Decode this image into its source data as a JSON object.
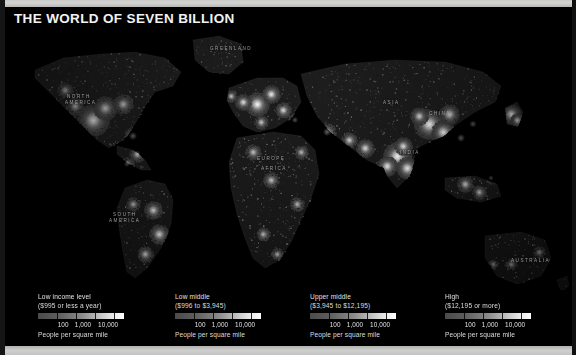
{
  "document": {
    "title": "THE WORLD OF SEVEN BILLION"
  },
  "map": {
    "name": "world-population-density-map",
    "background_color": "#000000",
    "geo_labels": [
      {
        "name": "greenland",
        "text": "GREENLAND",
        "x": 205,
        "y": 18
      },
      {
        "name": "north-america",
        "text": "NORTH",
        "x": 62,
        "y": 66
      },
      {
        "name": "north-america-2",
        "text": "AMERICA",
        "x": 60,
        "y": 72
      },
      {
        "name": "europe",
        "text": "EUROPE",
        "x": 252,
        "y": 128
      },
      {
        "name": "asia",
        "text": "ASIA",
        "x": 378,
        "y": 72
      },
      {
        "name": "china",
        "text": "CHINA",
        "x": 424,
        "y": 83
      },
      {
        "name": "india",
        "text": "INDIA",
        "x": 395,
        "y": 122
      },
      {
        "name": "africa",
        "text": "AFRICA",
        "x": 256,
        "y": 138
      },
      {
        "name": "south-america",
        "text": "SOUTH",
        "x": 108,
        "y": 184
      },
      {
        "name": "south-america-2",
        "text": "AMERICA",
        "x": 104,
        "y": 190
      },
      {
        "name": "australia",
        "text": "AUSTRALIA",
        "x": 506,
        "y": 230
      }
    ]
  },
  "legend": {
    "units_label": "People per square mile",
    "scale_ticks": [
      "100",
      "1,000",
      "10,000"
    ],
    "tick_positions_pct": [
      28,
      50,
      78
    ],
    "gradient_from": "#4a4a4a",
    "gradient_to": "#ffffff",
    "blocks": [
      {
        "id": "low-income",
        "title": "Low income level",
        "subtitle": "($995 or less a year)",
        "units": "People per square mile",
        "ticks": [
          "100",
          "1,000",
          "10,000"
        ]
      },
      {
        "id": "low-middle",
        "title": "Low middle",
        "subtitle": "($996 to $3,945)",
        "units": "People per square mile",
        "ticks": [
          "100",
          "1,000",
          "10,000"
        ]
      },
      {
        "id": "upper-middle",
        "title": "Upper middle",
        "subtitle": "($3,945 to $12,195)",
        "units": "People per square mile",
        "ticks": [
          "100",
          "1,000",
          "10,000"
        ]
      },
      {
        "id": "high",
        "title": "High",
        "subtitle": "($12,195 or more)",
        "units": "People per square mile",
        "ticks": [
          "100",
          "1,000",
          "10,000"
        ]
      }
    ]
  }
}
